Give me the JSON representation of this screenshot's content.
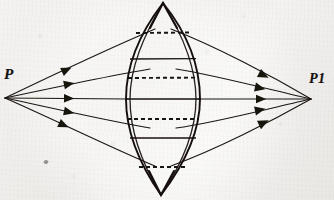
{
  "figure": {
    "kind": "hand-drawn-optics-ray-diagram",
    "background_color": "#f1f0ee",
    "ink_color": "#191512",
    "labels": {
      "source_point": "P",
      "image_point": "P1"
    },
    "points": {
      "source": {
        "x": 5,
        "y": 98
      },
      "image": {
        "x": 311,
        "y": 99
      },
      "lens_top_vertex": {
        "x": 163,
        "y": 3
      },
      "lens_bottom_vertex": {
        "x": 161,
        "y": 195
      },
      "lens_left_edge_x": 126,
      "lens_right_edge_x": 200
    },
    "lens": {
      "name": "biconvex-lens-vesica",
      "front_surface": "M163,3 C132,42 124,68 126,99 C124,131 134,160 161,195",
      "back_surface": "M163,3 C193,42 201,68 199,99 C201,131 191,160 161,195",
      "front_surface_inner": "M163,3 C136,44 129,70 130,99 C128,131 137,161 161,195",
      "back_surface_inner": "M163,3 C189,44 196,70 195,99 C197,131 188,161 161,195"
    },
    "chords": [
      {
        "name": "chord-1",
        "y": 33,
        "x1": 136,
        "x2": 190,
        "style": "dashed"
      },
      {
        "name": "chord-2",
        "y": 59,
        "x1": 130,
        "x2": 196,
        "style": "solid"
      },
      {
        "name": "chord-3",
        "y": 78,
        "x1": 128,
        "x2": 198,
        "style": "dashed"
      },
      {
        "name": "chord-4",
        "y": 99,
        "x1": 126,
        "x2": 200,
        "style": "solid"
      },
      {
        "name": "chord-5",
        "y": 119,
        "x1": 127,
        "x2": 199,
        "style": "dashed"
      },
      {
        "name": "chord-6",
        "y": 138,
        "x1": 130,
        "x2": 196,
        "style": "solid"
      },
      {
        "name": "chord-7",
        "y": 167,
        "x1": 139,
        "x2": 188,
        "style": "dashed"
      }
    ],
    "rays": [
      {
        "name": "ray-upper-outer",
        "incoming": "M5,98 L155,29",
        "outgoing": "M171,29 L311,99",
        "arrow_in": {
          "x": 60,
          "y": 73,
          "angle": -24.7
        },
        "arrow_out": {
          "x": 268,
          "y": 77,
          "angle": 26.6
        }
      },
      {
        "name": "ray-upper-inner",
        "incoming": "M5,98 L150,69",
        "outgoing": "M176,69 L311,99",
        "arrow_in": {
          "x": 64,
          "y": 86,
          "angle": -11.3
        },
        "arrow_out": {
          "x": 262,
          "y": 88,
          "angle": 12.5
        }
      },
      {
        "name": "ray-axis",
        "incoming": "M5,98 L126,99",
        "outgoing": "M200,99 L311,99",
        "arrow_in": {
          "x": 64,
          "y": 98,
          "angle": 0.5
        },
        "arrow_out": {
          "x": 262,
          "y": 99,
          "angle": 0
        }
      },
      {
        "name": "ray-lower-inner",
        "incoming": "M5,98 L150,128",
        "outgoing": "M176,128 L311,99",
        "arrow_in": {
          "x": 64,
          "y": 110,
          "angle": 11.7
        },
        "arrow_out": {
          "x": 262,
          "y": 110,
          "angle": -12.1
        }
      },
      {
        "name": "ray-lower-outer",
        "incoming": "M5,98 L155,166",
        "outgoing": "M171,166 L311,99",
        "arrow_in": {
          "x": 60,
          "y": 123,
          "angle": 24.4
        },
        "arrow_out": {
          "x": 268,
          "y": 122,
          "angle": -25.6
        }
      }
    ]
  }
}
